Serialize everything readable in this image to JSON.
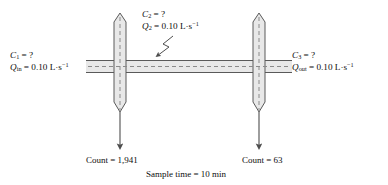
{
  "diagram": {
    "caption": "Sample time = 10 min",
    "colors": {
      "pipe_fill": "#e8e8e8",
      "pipe_stroke": "#5a5a5a",
      "centerline": "#8a8a8a",
      "arrow": "#4d4d4d",
      "text": "#0d0d0d",
      "background": "#ffffff"
    },
    "labels": {
      "inlet": {
        "concentration_symbol": "C",
        "concentration_sub": "1",
        "concentration_value": "?",
        "flow_symbol": "Q",
        "flow_sub": "in",
        "flow_value": "0.10",
        "flow_units": "L·s",
        "flow_units_exp": "−1"
      },
      "branch": {
        "concentration_symbol": "C",
        "concentration_sub": "2",
        "concentration_value": "?",
        "flow_symbol": "Q",
        "flow_sub": "2",
        "flow_value": "0.10",
        "flow_units": "L·s",
        "flow_units_exp": "−1"
      },
      "outlet": {
        "concentration_symbol": "C",
        "concentration_sub": "3",
        "concentration_value": "?",
        "flow_symbol": "Q",
        "flow_sub": "out",
        "flow_value": "0.10",
        "flow_units": "L·s",
        "flow_units_exp": "−1"
      },
      "equals": "=",
      "count_left": {
        "label": "Count",
        "equals": "=",
        "value": "1,941"
      },
      "count_right": {
        "label": "Count",
        "equals": "=",
        "value": "63"
      },
      "sample_time": {
        "label": "Sample time",
        "equals": "=",
        "value": "10",
        "units": "min"
      }
    }
  }
}
